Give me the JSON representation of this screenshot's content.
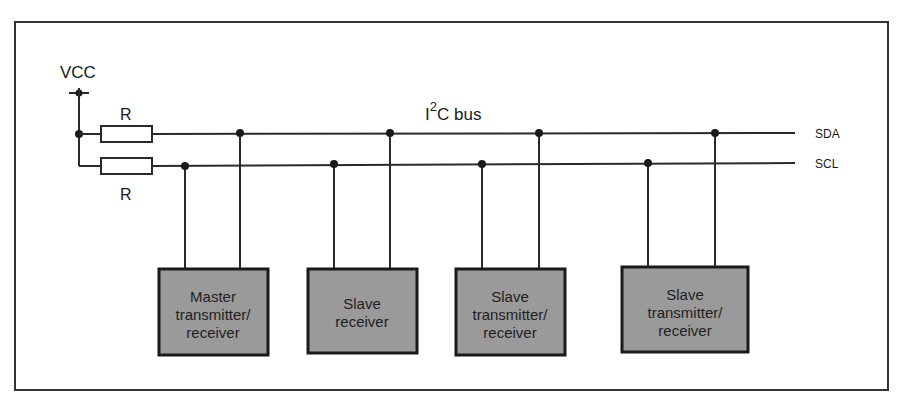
{
  "diagram": {
    "title": "I2C bus",
    "bus_label_prefix": "I",
    "bus_label_superscript": "2",
    "bus_label_suffix": "C bus",
    "supply_label": "VCC",
    "resistor_top_label": "R",
    "resistor_bottom_label": "R",
    "lines": {
      "sda_label": "SDA",
      "scl_label": "SCL"
    },
    "devices": [
      {
        "line1": "Master",
        "line2": "transmitter/",
        "line3": "receiver"
      },
      {
        "line1": "Slave",
        "line2": "receiver",
        "line3": ""
      },
      {
        "line1": "Slave",
        "line2": "transmitter/",
        "line3": "receiver"
      },
      {
        "line1": "Slave",
        "line2": "transmitter/",
        "line3": "receiver"
      }
    ],
    "colors": {
      "line": "#2a2a2a",
      "device_fill": "#9a9a9a",
      "device_border": "#1a1a1a",
      "frame": "#333333"
    }
  }
}
